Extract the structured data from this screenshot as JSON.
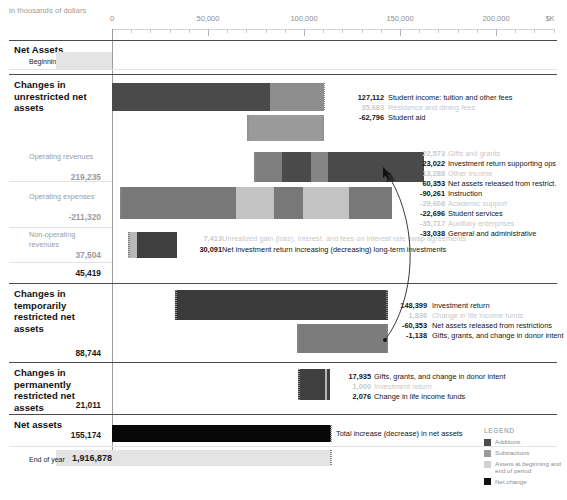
{
  "header": {
    "units_note": "in thousands of dollars"
  },
  "axis": {
    "unit_suffix": "$K",
    "ticks": [
      {
        "label": "0",
        "value": 0
      },
      {
        "label": "50,000",
        "value": 50000
      },
      {
        "label": "100,000",
        "value": 100000
      },
      {
        "label": "150,000",
        "value": 150000
      },
      {
        "label": "200,000",
        "value": 200000
      }
    ],
    "min": 0,
    "max": 230000
  },
  "sections": {
    "net_assets_top": {
      "title": "Net Assets",
      "row_label": "Beginning of year",
      "value": "1,761,704"
    },
    "unrestricted": {
      "title": "Changes in unrestricted net assets"
    },
    "operating_revenues": {
      "label": "Operating revenues",
      "total": "219,235"
    },
    "operating_expenses": {
      "label": "Operating expenses",
      "total": "-211,320"
    },
    "nonoperating": {
      "label": "Non-operating revenues",
      "total": "37,504"
    },
    "unrestricted_total": {
      "value": "45,419"
    },
    "temporarily": {
      "title": "Changes in temporarily restricted net assets",
      "total": "88,744"
    },
    "permanently": {
      "title": "Changes in permanently restricted net assets",
      "total": "21,011"
    },
    "net_assets_bottom": {
      "title": "Net assets",
      "value": "155,174",
      "caption": "Total increase (decrease) in net assets"
    },
    "end_of_year": {
      "row_label": "End of year",
      "value": "1,916,878"
    }
  },
  "items": {
    "student_income": {
      "value": "127,112",
      "label": "Student income: tuition and other fees",
      "highlighted": true
    },
    "residence_dining": {
      "value": "35,683",
      "label": "Residence and dining fees",
      "highlighted": false
    },
    "student_aid": {
      "value": "-62,796",
      "label": "Student aid",
      "highlighted": true
    },
    "gifts_grants": {
      "value": "22,573",
      "label": "Gifts and grants",
      "highlighted": false
    },
    "investment_return_ops": {
      "value": "23,022",
      "label": "Investment return supporting ops",
      "highlighted": true
    },
    "other_income": {
      "value": "13,288",
      "label": "Other income",
      "highlighted": false
    },
    "net_released": {
      "value": "60,353",
      "label": "Net assets released from restrict.",
      "highlighted": true
    },
    "instruction": {
      "value": "-90,261",
      "label": "Instruction",
      "highlighted": true
    },
    "academic_support": {
      "value": "-29,608",
      "label": "Academic support",
      "highlighted": false
    },
    "student_services": {
      "value": "-22,696",
      "label": "Student services",
      "highlighted": true
    },
    "auxiliary": {
      "value": "-35,717",
      "label": "Auxiliary enterprises",
      "highlighted": false
    },
    "general_admin": {
      "value": "-33,038",
      "label": "General and administrative",
      "highlighted": true
    },
    "swap": {
      "value": "7,413",
      "label": "Unrealized gain (loss), interest, and fees on interest rate swap agreements",
      "highlighted": false
    },
    "net_invest_return": {
      "value": "30,091",
      "label": "Net investment return increasing (decreasing) long-term investments",
      "highlighted": true
    },
    "tr_investment_return": {
      "value": "148,399",
      "label": "Investment return",
      "highlighted": true
    },
    "tr_life_income": {
      "value": "1,836",
      "label": "Change in life income funds",
      "highlighted": false
    },
    "tr_released": {
      "value": "-60,353",
      "label": "Net assets released from restrictions",
      "highlighted": true
    },
    "tr_gifts": {
      "value": "-1,138",
      "label": "Gifts, grants, and change in donor intent",
      "highlighted": true
    },
    "pr_gifts": {
      "value": "17,935",
      "label": "Gifts, grants, and change in donor intent",
      "highlighted": true
    },
    "pr_investment": {
      "value": "1,000",
      "label": "Investment return",
      "highlighted": false
    },
    "pr_life_income": {
      "value": "2,076",
      "label": "Change in life income funds",
      "highlighted": true
    }
  },
  "legend": {
    "title": "LEGEND",
    "entries": [
      {
        "label": "Additions",
        "color": "#4d4d4d"
      },
      {
        "label": "Subtractions",
        "color": "#9a9a9a"
      },
      {
        "label": "Assets at beginning and end of period",
        "color": "#d2d2d2"
      },
      {
        "label": "Net change",
        "color": "#121212"
      }
    ]
  },
  "colors": {
    "addition": "#4d4d4d",
    "subtraction": "#9a9a9a",
    "assets": "#d9d9d9",
    "net_change": "#121212",
    "faded_dark": "#7d7d7d",
    "faded_light": "#c6c6c6"
  }
}
